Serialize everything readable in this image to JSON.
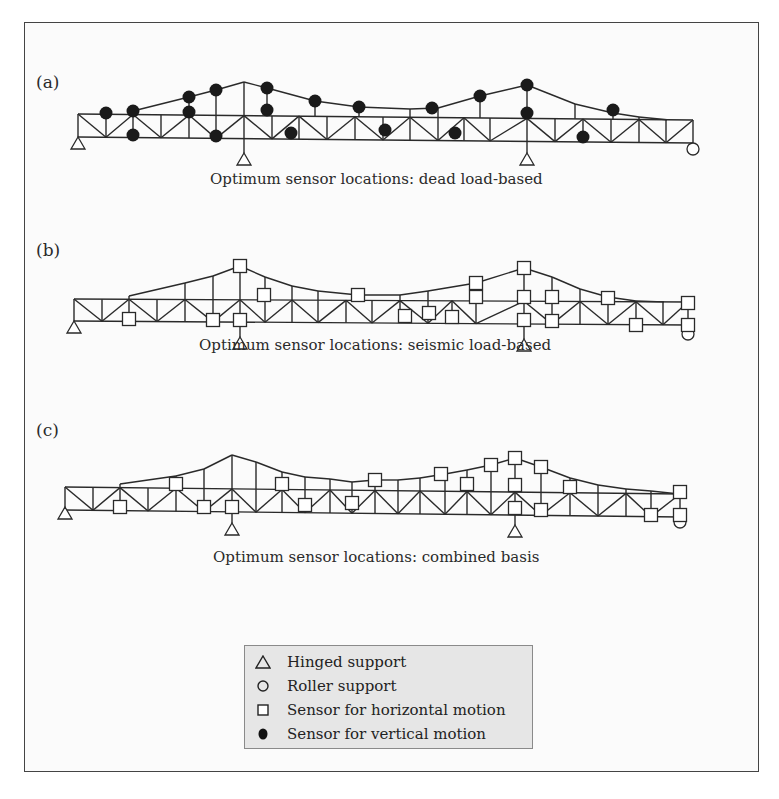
{
  "figure": {
    "panels": [
      {
        "id": "a",
        "label": "(a)",
        "caption": "Optimum sensor locations: dead load-based",
        "label_pos": [
          36,
          86
        ],
        "caption_pos": [
          210,
          176
        ],
        "truss": {
          "nodes_x": [
            78,
            106,
            133,
            161,
            189,
            216,
            244,
            272,
            299,
            327,
            355,
            383,
            410,
            438,
            464,
            490,
            527,
            555,
            583,
            611,
            639,
            666,
            693
          ],
          "bottom_y_start": 137,
          "bottom_y_end": 143,
          "mid_y_start": 114,
          "mid_y_end": 120,
          "arch": [
            [
              133,
              111
            ],
            [
              189,
              97
            ],
            [
              216,
              90
            ],
            [
              244,
              82
            ],
            [
              267,
              88
            ],
            [
              315,
              101
            ],
            [
              359,
              107
            ],
            [
              410,
              109
            ],
            [
              438,
              108
            ],
            [
              480,
              96
            ],
            [
              527,
              85
            ],
            [
              575,
              104
            ],
            [
              613,
              113
            ],
            [
              639,
              117
            ]
          ],
          "diag_pattern": "alt"
        },
        "hinges": [
          [
            78,
            144
          ],
          [
            244,
            160
          ],
          [
            527,
            160
          ]
        ],
        "rollers": [
          [
            693,
            149
          ]
        ],
        "filled_sensors": [
          [
            106,
            113
          ],
          [
            133,
            111
          ],
          [
            133,
            135
          ],
          [
            189,
            97
          ],
          [
            189,
            112
          ],
          [
            216,
            90
          ],
          [
            216,
            136
          ],
          [
            267,
            88
          ],
          [
            267,
            110
          ],
          [
            291,
            133
          ],
          [
            315,
            101
          ],
          [
            359,
            107
          ],
          [
            385,
            130
          ],
          [
            432,
            108
          ],
          [
            455,
            133
          ],
          [
            480,
            96
          ],
          [
            527,
            85
          ],
          [
            527,
            113
          ],
          [
            583,
            137
          ],
          [
            613,
            110
          ]
        ],
        "squares": []
      },
      {
        "id": "b",
        "label": "(b)",
        "caption": "Optimum sensor locations: seismic load-based",
        "label_pos": [
          36,
          254
        ],
        "caption_pos": [
          199,
          342
        ],
        "truss": {
          "nodes_x": [
            74,
            102,
            129,
            157,
            185,
            213,
            240,
            265,
            292,
            318,
            346,
            372,
            400,
            428,
            452,
            476,
            524,
            552,
            580,
            608,
            636,
            663,
            688
          ],
          "bottom_y_start": 321,
          "bottom_y_end": 325,
          "mid_y_start": 299,
          "mid_y_end": 302,
          "arch": [
            [
              129,
              296
            ],
            [
              185,
              283
            ],
            [
              213,
              276
            ],
            [
              240,
              266
            ],
            [
              265,
              277
            ],
            [
              292,
              286
            ],
            [
              318,
              291
            ],
            [
              358,
              295
            ],
            [
              400,
              295
            ],
            [
              428,
              291
            ],
            [
              476,
              283
            ],
            [
              524,
              268
            ],
            [
              552,
              277
            ],
            [
              580,
              289
            ],
            [
              608,
              297
            ],
            [
              636,
              301
            ]
          ],
          "diag_pattern": "alt"
        },
        "hinges": [
          [
            74,
            328
          ],
          [
            240,
            344
          ],
          [
            524,
            346
          ]
        ],
        "rollers": [
          [
            688,
            334
          ]
        ],
        "filled_sensors": [],
        "squares": [
          [
            240,
            266
          ],
          [
            264,
            295
          ],
          [
            358,
            295
          ],
          [
            129,
            319
          ],
          [
            213,
            320
          ],
          [
            240,
            320
          ],
          [
            405,
            316
          ],
          [
            429,
            313
          ],
          [
            452,
            317
          ],
          [
            476,
            283
          ],
          [
            476,
            297
          ],
          [
            524,
            268
          ],
          [
            524,
            297
          ],
          [
            552,
            297
          ],
          [
            524,
            320
          ],
          [
            552,
            321
          ],
          [
            608,
            298
          ],
          [
            636,
            325
          ],
          [
            688,
            303
          ],
          [
            688,
            325
          ]
        ]
      },
      {
        "id": "c",
        "label": "(c)",
        "caption": "Optimum sensor locations: combined basis",
        "label_pos": [
          36,
          434
        ],
        "caption_pos": [
          213,
          554
        ],
        "truss": {
          "nodes_x": [
            65,
            93,
            120,
            148,
            176,
            204,
            232,
            256,
            282,
            305,
            330,
            352,
            375,
            398,
            420,
            445,
            467,
            491,
            515,
            541,
            570,
            598,
            626,
            651,
            680
          ],
          "bottom_y_start": 510,
          "bottom_y_end": 517,
          "mid_y_start": 487,
          "mid_y_end": 494,
          "arch": [
            [
              120,
              484
            ],
            [
              176,
              476
            ],
            [
              204,
              469
            ],
            [
              232,
              455
            ],
            [
              256,
              462
            ],
            [
              282,
              472
            ],
            [
              305,
              477
            ],
            [
              330,
              479
            ],
            [
              352,
              482
            ],
            [
              375,
              480
            ],
            [
              398,
              480
            ],
            [
              420,
              478
            ],
            [
              445,
              474
            ],
            [
              467,
              470
            ],
            [
              491,
              465
            ],
            [
              515,
              458
            ],
            [
              541,
              467
            ],
            [
              570,
              478
            ],
            [
              598,
              485
            ],
            [
              626,
              489
            ],
            [
              651,
              491
            ]
          ],
          "diag_pattern": "alt"
        },
        "hinges": [
          [
            65,
            514
          ],
          [
            232,
            530
          ],
          [
            515,
            532
          ]
        ],
        "rollers": [
          [
            680,
            522
          ]
        ],
        "filled_sensors": [],
        "squares": [
          [
            176,
            484
          ],
          [
            120,
            507
          ],
          [
            204,
            507
          ],
          [
            232,
            507
          ],
          [
            305,
            505
          ],
          [
            352,
            503
          ],
          [
            375,
            480
          ],
          [
            441,
            474
          ],
          [
            467,
            484
          ],
          [
            491,
            465
          ],
          [
            515,
            458
          ],
          [
            541,
            467
          ],
          [
            515,
            485
          ],
          [
            515,
            508
          ],
          [
            541,
            510
          ],
          [
            570,
            487
          ],
          [
            651,
            515
          ],
          [
            680,
            492
          ],
          [
            680,
            515
          ],
          [
            282,
            484
          ]
        ]
      }
    ],
    "legend": {
      "items": [
        {
          "symbol": "triangle",
          "label": "Hinged support"
        },
        {
          "symbol": "circle",
          "label": "Roller support"
        },
        {
          "symbol": "square",
          "label": "Sensor for horizontal motion"
        },
        {
          "symbol": "filled-circle",
          "label": "Sensor for vertical motion"
        }
      ]
    },
    "colors": {
      "line": "#2a2a2a",
      "filled_sensor": "#1a1a1a",
      "square_fill": "#ffffff",
      "legend_bg": "#e6e6e6",
      "frame": "#444444"
    }
  }
}
